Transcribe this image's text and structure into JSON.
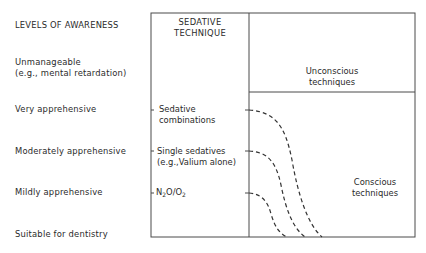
{
  "left_column": {
    "header": "LEVELS OF AWARENESS",
    "levels": [
      {
        "line1": "Unmanageable",
        "line2": "(e.g., mental retardation)"
      },
      {
        "line1": "Very apprehensive"
      },
      {
        "line1": "Moderately apprehensive"
      },
      {
        "line1": "Mildly apprehensive"
      },
      {
        "line1": "Suitable for dentistry"
      }
    ]
  },
  "middle_column": {
    "header_line1": "SEDATIVE",
    "header_line2": "TECHNIQUE",
    "techniques": [
      {
        "line1": "Sedative",
        "line2": "combinations"
      },
      {
        "line1": "Single sedatives",
        "line2": "(e.g.,Valium alone)"
      },
      {
        "n2o_prefix": "N",
        "n2o_sub1": "2",
        "n2o_mid": "O/O",
        "n2o_sub2": "2"
      }
    ]
  },
  "right_column": {
    "unconscious_line1": "Unconscious",
    "unconscious_line2": "techniques",
    "conscious_line1": "Conscious",
    "conscious_line2": "techniques"
  },
  "colors": {
    "line": "#4a4a4a",
    "text": "#2a2a2a"
  }
}
